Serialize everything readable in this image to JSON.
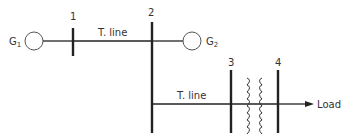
{
  "diagram": {
    "type": "one-line power system diagram",
    "generators": [
      {
        "id": "G1",
        "label": "G",
        "subscript": "1",
        "connected_bus": "1"
      },
      {
        "id": "G2",
        "label": "G",
        "subscript": "2",
        "connected_bus": "2"
      }
    ],
    "buses": [
      {
        "id": "1",
        "label": "1"
      },
      {
        "id": "2",
        "label": "2"
      },
      {
        "id": "3",
        "label": "3"
      },
      {
        "id": "4",
        "label": "4"
      }
    ],
    "lines": [
      {
        "from": "1",
        "to": "2",
        "label": "T. line"
      },
      {
        "from": "2",
        "to": "3",
        "label": "T. line"
      }
    ],
    "transformers": [
      {
        "from": "3",
        "to": "4"
      }
    ],
    "load": {
      "bus": "4",
      "label": "Load"
    },
    "colors": {
      "stroke": "#222222",
      "text": "#333333"
    }
  }
}
